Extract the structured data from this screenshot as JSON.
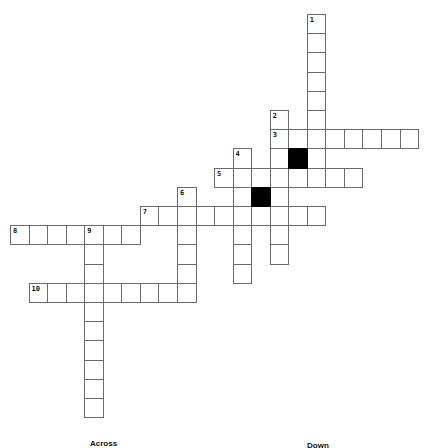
{
  "puzzle": {
    "grid_origin": {
      "x": 10,
      "y": 14
    },
    "cell_size": {
      "w": 18.55,
      "h": 19.2
    },
    "entries": [
      {
        "number": "1",
        "direction": "down",
        "row": 0,
        "col": 16,
        "length": 9
      },
      {
        "number": "2",
        "direction": "down",
        "row": 5,
        "col": 14,
        "length": 8
      },
      {
        "number": "3",
        "direction": "across",
        "row": 6,
        "col": 14,
        "length": 8
      },
      {
        "number": "4",
        "direction": "down",
        "row": 7,
        "col": 12,
        "length": 7
      },
      {
        "number": "5",
        "direction": "across",
        "row": 8,
        "col": 11,
        "length": 8
      },
      {
        "number": "6",
        "direction": "down",
        "row": 9,
        "col": 9,
        "length": 6
      },
      {
        "number": "7",
        "direction": "across",
        "row": 10,
        "col": 7,
        "length": 10
      },
      {
        "number": "8",
        "direction": "across",
        "row": 11,
        "col": 0,
        "length": 7
      },
      {
        "number": "9",
        "direction": "down",
        "row": 11,
        "col": 4,
        "length": 10
      },
      {
        "number": "10",
        "direction": "across",
        "row": 14,
        "col": 1,
        "length": 9
      }
    ],
    "black_cells": [
      {
        "row": 7,
        "col": 15
      },
      {
        "row": 9,
        "col": 13
      }
    ]
  },
  "clues": {
    "across_heading": "Across",
    "down_heading": "Down"
  }
}
